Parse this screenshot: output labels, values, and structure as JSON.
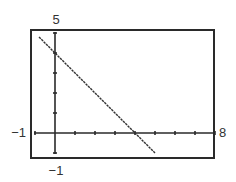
{
  "chart_data": {
    "type": "line",
    "title": "",
    "xlabel": "",
    "ylabel": "",
    "xlim": [
      -1,
      8
    ],
    "ylim": [
      -1,
      5
    ],
    "grid": false,
    "legend": null,
    "x_tick_step": 1,
    "y_tick_step": 1,
    "window_labels": {
      "xmin": "−1",
      "xmax": "8",
      "ymin": "−1",
      "ymax": "5"
    },
    "series": [
      {
        "name": "y = -x + 4",
        "x": [
          -0.8,
          0,
          1,
          2,
          3,
          4,
          5
        ],
        "y": [
          4.8,
          4,
          3,
          2,
          1,
          0,
          -1
        ]
      }
    ],
    "colors": {
      "frame": "#2a2a2a",
      "axes": "#2a2a2a",
      "line": "#333333"
    }
  }
}
